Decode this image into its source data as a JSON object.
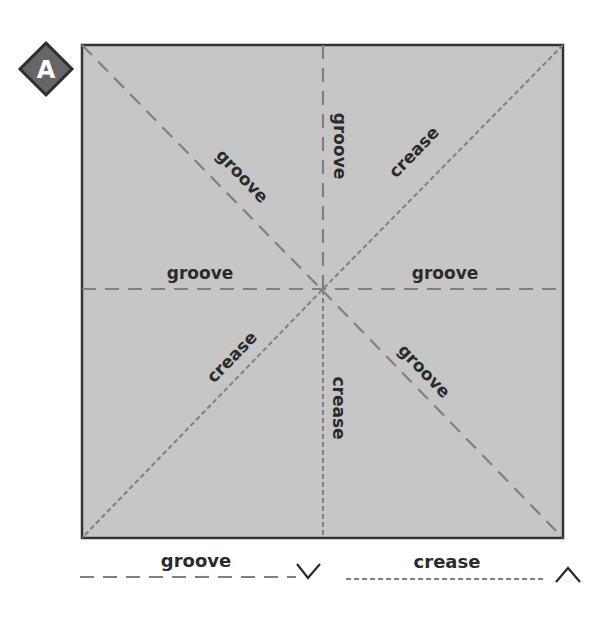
{
  "badge": {
    "letter": "A",
    "fill": "#666666",
    "border": "#2e2e2e"
  },
  "square": {
    "fill": "#c6c6c6",
    "border": "#333333"
  },
  "colors": {
    "fold_line": "#808080",
    "text": "#2b2b2b"
  },
  "fold_labels": {
    "upper_left_diagonal": "groove",
    "top_vertical": "groove",
    "upper_right_diagonal": "crease",
    "left_horizontal": "groove",
    "right_horizontal": "groove",
    "lower_left_diagonal": "crease",
    "bottom_vertical": "crease",
    "lower_right_diagonal": "groove"
  },
  "legend": {
    "groove": {
      "label": "groove",
      "symbol": "valley-v"
    },
    "crease": {
      "label": "crease",
      "symbol": "mountain-caret"
    }
  }
}
